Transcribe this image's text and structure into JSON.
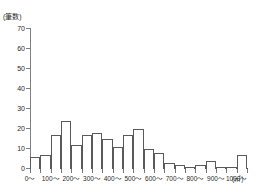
{
  "chart_data": {
    "type": "bar",
    "title": "",
    "subtitle": "",
    "xlabel": "",
    "ylabel": "",
    "y_unit_label": "(筆数)",
    "x_unit_label": "(㎡)",
    "grid": false,
    "legend": null,
    "bin_width": 50,
    "xlim": [
      0,
      1050
    ],
    "ylim": [
      0,
      70
    ],
    "y_ticks": [
      70,
      60,
      50,
      40,
      30,
      20,
      10,
      0
    ],
    "y_tick_labels": [
      "70",
      "60",
      "50",
      "40",
      "30",
      "20",
      "10",
      "0"
    ],
    "x_ticks": [
      0,
      50,
      100,
      150,
      200,
      250,
      300,
      350,
      400,
      450,
      500,
      550,
      600,
      650,
      700,
      750,
      800,
      850,
      900,
      950,
      1000,
      1050
    ],
    "x_tick_labels": [
      "0～",
      "",
      "100～",
      "",
      "200～",
      "",
      "300～",
      "",
      "400～",
      "",
      "500～",
      "",
      "600～",
      "",
      "700～",
      "",
      "800～",
      "",
      "900～",
      "",
      "1000～",
      ""
    ],
    "categories": [
      "0～50",
      "50～100",
      "100～150",
      "150～200",
      "200～250",
      "250～300",
      "300～350",
      "350～400",
      "400～450",
      "450～500",
      "500～550",
      "550～600",
      "600～650",
      "650～700",
      "700～750",
      "750～800",
      "800～850",
      "850～900",
      "900～950",
      "950～1000",
      "1000～1050"
    ],
    "values": [
      6,
      7,
      17,
      24,
      12,
      17,
      18,
      15,
      11,
      17,
      20,
      10,
      8,
      3,
      2,
      1,
      2,
      4,
      1,
      1,
      7
    ]
  }
}
